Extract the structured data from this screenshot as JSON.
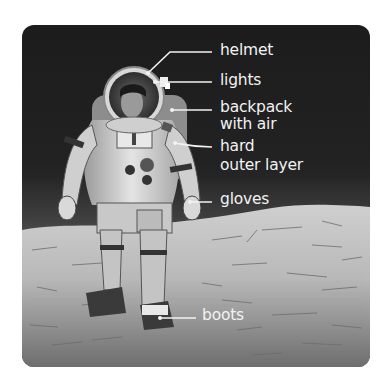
{
  "diagram": {
    "type": "labeled-illustration",
    "colors": {
      "sky": "#1f1f1f",
      "ground": "#bdbdbd",
      "label_text": "#f2f2f2",
      "leader_line": "#f2f2f2"
    },
    "labels": [
      {
        "id": "helmet",
        "lines": [
          "helmet"
        ]
      },
      {
        "id": "lights",
        "lines": [
          "lights"
        ]
      },
      {
        "id": "backpack",
        "lines": [
          "backpack",
          "with air"
        ]
      },
      {
        "id": "outer-layer",
        "lines": [
          "hard",
          "outer layer"
        ]
      },
      {
        "id": "gloves",
        "lines": [
          "gloves"
        ]
      },
      {
        "id": "boots",
        "lines": [
          "boots"
        ]
      }
    ]
  }
}
